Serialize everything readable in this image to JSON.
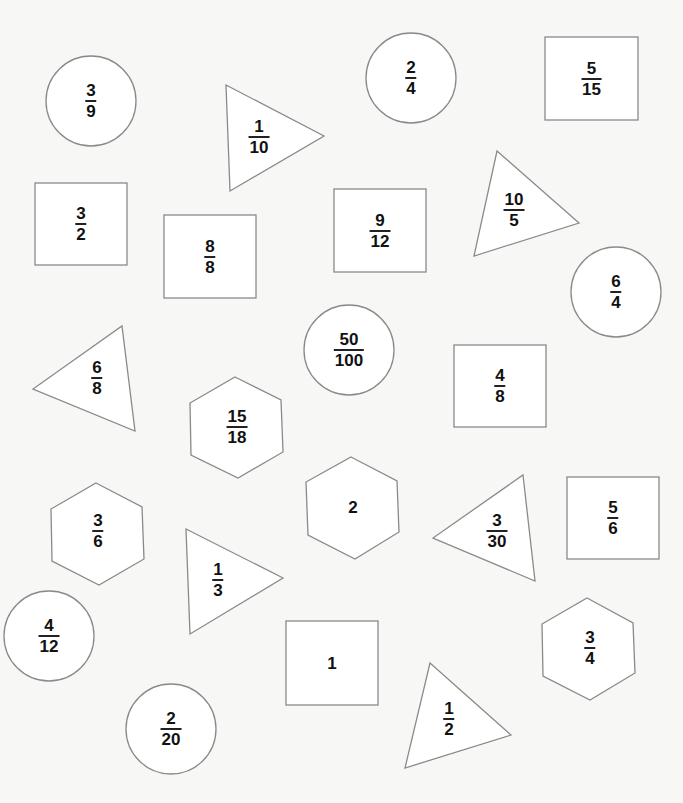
{
  "worksheet": {
    "background": "#f7f7f6",
    "stroke_color": "#8a8a8a",
    "text_color": "#111111",
    "shapes": [
      {
        "type": "circle",
        "num": "3",
        "den": "9",
        "cx": 91,
        "cy": 101,
        "r": 45
      },
      {
        "type": "triangle",
        "num": "1",
        "den": "10",
        "points": "226,85 324,136 230,191",
        "lx": 259,
        "ly": 137
      },
      {
        "type": "circle",
        "num": "2",
        "den": "4",
        "cx": 411,
        "cy": 78,
        "r": 45
      },
      {
        "type": "square",
        "num": "5",
        "den": "15",
        "x": 545,
        "y": 37,
        "w": 93,
        "h": 83
      },
      {
        "type": "square",
        "num": "3",
        "den": "2",
        "x": 35,
        "y": 183,
        "w": 92,
        "h": 82
      },
      {
        "type": "square",
        "num": "8",
        "den": "8",
        "x": 164,
        "y": 215,
        "w": 92,
        "h": 83
      },
      {
        "type": "square",
        "num": "9",
        "den": "12",
        "x": 334,
        "y": 189,
        "w": 92,
        "h": 83
      },
      {
        "type": "triangle",
        "num": "10",
        "den": "5",
        "points": "497,151 579,223 474,256",
        "lx": 514,
        "ly": 210
      },
      {
        "type": "circle",
        "num": "6",
        "den": "4",
        "cx": 616,
        "cy": 292,
        "r": 45
      },
      {
        "type": "circle",
        "num": "50",
        "den": "100",
        "cx": 349,
        "cy": 350,
        "r": 45
      },
      {
        "type": "triangle",
        "num": "6",
        "den": "8",
        "points": "122,326 135,431 33,389",
        "lx": 97,
        "ly": 378
      },
      {
        "type": "square",
        "num": "4",
        "den": "8",
        "x": 454,
        "y": 345,
        "w": 92,
        "h": 82
      },
      {
        "type": "hexagon",
        "num": "15",
        "den": "18",
        "points": "235,377 281,400 283,452 238,478 191,455 190,403",
        "lx": 237,
        "ly": 427
      },
      {
        "type": "hexagon",
        "num": "2",
        "den": "",
        "points": "351,457 397,481 399,532 355,559 308,535 306,482",
        "lx": 353,
        "ly": 507
      },
      {
        "type": "hexagon",
        "num": "3",
        "den": "6",
        "points": "96,483 142,507 144,559 99,585 52,561 51,509",
        "lx": 98,
        "ly": 531
      },
      {
        "type": "triangle",
        "num": "3",
        "den": "30",
        "points": "523,475 535,581 433,538",
        "lx": 497,
        "ly": 531
      },
      {
        "type": "square",
        "num": "5",
        "den": "6",
        "x": 567,
        "y": 477,
        "w": 92,
        "h": 82
      },
      {
        "type": "triangle",
        "num": "1",
        "den": "3",
        "points": "186,529 283,578 190,634",
        "lx": 218,
        "ly": 580
      },
      {
        "type": "circle",
        "num": "4",
        "den": "12",
        "cx": 49,
        "cy": 636,
        "r": 45
      },
      {
        "type": "square",
        "num": "1",
        "den": "",
        "x": 286,
        "y": 621,
        "w": 92,
        "h": 84
      },
      {
        "type": "hexagon",
        "num": "3",
        "den": "4",
        "points": "587,598 633,623 635,673 590,700 543,676 542,624",
        "lx": 590,
        "ly": 648
      },
      {
        "type": "circle",
        "num": "2",
        "den": "20",
        "cx": 171,
        "cy": 729,
        "r": 45
      },
      {
        "type": "triangle",
        "num": "1",
        "den": "2",
        "points": "430,663 511,735 405,768",
        "lx": 449,
        "ly": 719
      }
    ]
  }
}
